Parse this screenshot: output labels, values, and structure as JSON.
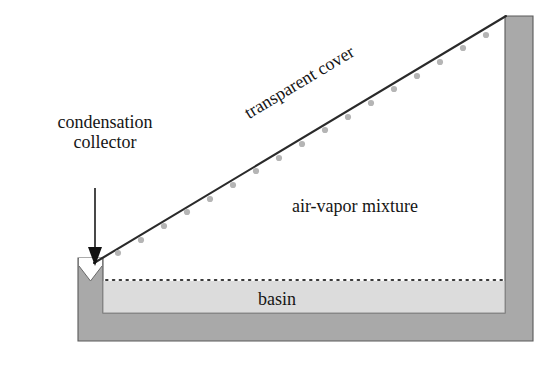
{
  "diagram": {
    "labels": {
      "condensation_line1": "condensation",
      "condensation_line2": "collector",
      "transparent_cover": "transparent cover",
      "air_vapor_mixture": "air-vapor mixture",
      "basin": "basin"
    },
    "colors": {
      "wall_gray": "#a9a9a9",
      "water_gray": "#dcdcdc",
      "outline": "#4a4a4a",
      "line_dark": "#2a2a2a",
      "droplet": "#b5b5b5",
      "background": "#ffffff",
      "text": "#151515"
    },
    "geometry": {
      "outer_left_x": 78,
      "outer_right_x": 533,
      "outer_bottom_y": 341,
      "cavity_left_x": 103,
      "cavity_right_x": 505,
      "cavity_bottom_y": 313,
      "collector_top_y": 258,
      "right_wall_top_y": 16,
      "cover_start": [
        95,
        262
      ],
      "cover_end": [
        505,
        16
      ],
      "water_surface_y": 280,
      "arrow_x": 95,
      "arrow_top_y": 188,
      "arrow_tip_y": 262,
      "notch_center_x": 90,
      "notch_depth": 22,
      "droplet_count": 18,
      "water_dot_count": 60
    },
    "icons": {
      "arrow": "arrow-down-icon",
      "droplet": "water-droplet-icon"
    }
  }
}
